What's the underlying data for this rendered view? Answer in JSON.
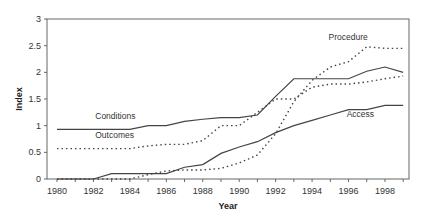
{
  "chart_data": {
    "type": "line",
    "title": "",
    "xlabel": "Year",
    "ylabel": "Index",
    "xlim": [
      1980,
      1999
    ],
    "ylim": [
      0,
      3
    ],
    "x_ticks": [
      "1980",
      "1982",
      "1984",
      "1986",
      "1988",
      "1990",
      "1992",
      "1994",
      "1996",
      "1998"
    ],
    "y_ticks": [
      "0",
      "0.5",
      "1",
      "1.5",
      "2",
      "2.5",
      "3"
    ],
    "grid": false,
    "legend": "inline labels",
    "x": [
      1980,
      1981,
      1982,
      1983,
      1984,
      1985,
      1986,
      1987,
      1988,
      1989,
      1990,
      1991,
      1992,
      1993,
      1994,
      1995,
      1996,
      1997,
      1998,
      1999
    ],
    "series": [
      {
        "name": "Conditions",
        "style": "solid",
        "values": [
          0.93,
          0.93,
          0.93,
          0.93,
          0.93,
          1.0,
          1.0,
          1.08,
          1.12,
          1.15,
          1.15,
          1.2,
          1.55,
          1.88,
          1.88,
          1.88,
          1.88,
          2.02,
          2.1,
          2.0
        ]
      },
      {
        "name": "Outcomes",
        "style": "dotted",
        "values": [
          0.57,
          0.57,
          0.57,
          0.57,
          0.57,
          0.62,
          0.65,
          0.65,
          0.72,
          1.0,
          1.0,
          1.25,
          1.5,
          1.5,
          1.72,
          1.78,
          1.78,
          1.82,
          1.88,
          1.93
        ]
      },
      {
        "name": "Access",
        "style": "solid",
        "values": [
          0,
          0,
          0,
          0.1,
          0.1,
          0.1,
          0.1,
          0.22,
          0.27,
          0.48,
          0.6,
          0.7,
          0.87,
          1.0,
          1.1,
          1.2,
          1.3,
          1.3,
          1.38,
          1.38
        ]
      },
      {
        "name": "Procedure",
        "style": "dotted",
        "values": [
          0,
          0,
          0,
          0,
          0,
          0.08,
          0.15,
          0.17,
          0.17,
          0.2,
          0.3,
          0.45,
          0.85,
          1.45,
          1.85,
          2.1,
          2.2,
          2.48,
          2.45,
          2.45
        ]
      }
    ],
    "annotations": [
      {
        "text": "Conditions",
        "x": 1982.1,
        "y": 1.13
      },
      {
        "text": "Outcomes",
        "x": 1982.1,
        "y": 0.77
      },
      {
        "text": "Access",
        "x": 1995.9,
        "y": 1.17
      },
      {
        "text": "Procedure",
        "x": 1994.9,
        "y": 2.6
      }
    ]
  },
  "colors": {
    "line": "#444444",
    "frame": "#666666",
    "text": "#333333"
  }
}
